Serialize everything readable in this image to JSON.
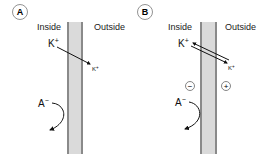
{
  "colors": {
    "membrane_fill": "#d9d9d9",
    "membrane_border": "#8a8a8a",
    "line": "#111111",
    "circle_stroke": "#777777"
  },
  "panels": [
    {
      "id": "A",
      "label": "A",
      "inside_label": "Inside",
      "outside_label": "Outside",
      "k_inside": {
        "base": "K",
        "charge": "+"
      },
      "k_outside": {
        "base": "K",
        "charge": "+"
      },
      "anion": {
        "base": "A",
        "charge": "−"
      },
      "k_arrow": "single, inside to outside",
      "charge_signs": []
    },
    {
      "id": "B",
      "label": "B",
      "inside_label": "Inside",
      "outside_label": "Outside",
      "k_inside": {
        "base": "K",
        "charge": "+"
      },
      "k_outside": {
        "base": "K",
        "charge": "+"
      },
      "anion": {
        "base": "A",
        "charge": "−"
      },
      "k_arrow": "double, bidirectional equilibrium",
      "charge_signs": [
        {
          "side": "inside",
          "sign": "−"
        },
        {
          "side": "outside",
          "sign": "+"
        }
      ]
    }
  ]
}
